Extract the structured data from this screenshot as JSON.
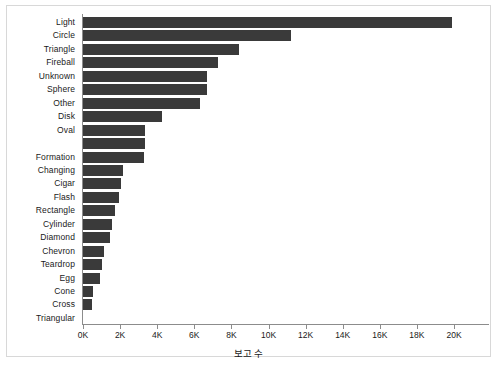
{
  "chart_data": {
    "type": "bar",
    "orientation": "horizontal",
    "title": "",
    "xlabel": "보고 수",
    "ylabel": "",
    "xlim": [
      0,
      21500
    ],
    "grid": false,
    "legend": false,
    "bar_color": "#3a3a3a",
    "tick_labels": [
      "0K",
      "2K",
      "4K",
      "6K",
      "8K",
      "10K",
      "12K",
      "14K",
      "16K",
      "18K",
      "20K"
    ],
    "tick_values": [
      0,
      2000,
      4000,
      6000,
      8000,
      10000,
      12000,
      14000,
      16000,
      18000,
      20000
    ],
    "categories": [
      "Light",
      "Circle",
      "Triangle",
      "Fireball",
      "Unknown",
      "Sphere",
      "Other",
      "Disk",
      "Oval",
      "",
      "Formation",
      "Changing",
      "Cigar",
      "Flash",
      "Rectangle",
      "Cylinder",
      "Diamond",
      "Chevron",
      "Teardrop",
      "Egg",
      "Cone",
      "Cross",
      "Triangular"
    ],
    "values": [
      19900,
      11200,
      8400,
      7300,
      6700,
      6700,
      6300,
      4250,
      3350,
      3350,
      3300,
      2150,
      2050,
      1950,
      1750,
      1550,
      1450,
      1150,
      1050,
      900,
      550,
      500,
      0
    ]
  }
}
